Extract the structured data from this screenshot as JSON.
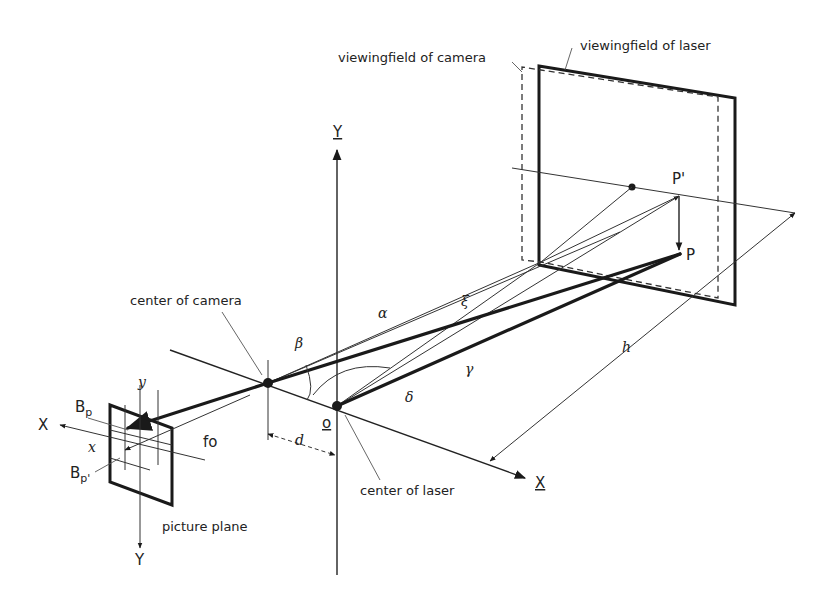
{
  "figure": {
    "type": "technical-diagram"
  },
  "labels": {
    "viewingfield_camera": "viewingfield of camera",
    "viewingfield_laser": "viewingfield of laser",
    "center_camera": "center of camera",
    "center_laser": "center of laser",
    "picture_plane": "picture plane",
    "point_p_prime": "P'",
    "point_p": "P",
    "axis_Y_world": "Y",
    "axis_X_world": "X",
    "axis_X_image": "X",
    "axis_Y_image": "Y",
    "axis_x_small": "x",
    "axis_y_small": "y",
    "origin": "o",
    "bp": "B",
    "bp_sub": "p",
    "bp_prime": "B",
    "bp_prime_sub": "p'",
    "focal": "fo",
    "distance_d": "d",
    "distance_h": "h",
    "alpha": "α",
    "beta": "β",
    "gamma": "γ",
    "delta": "δ",
    "zeta": "ξ"
  },
  "colors": {
    "ink": "#1a1a1a",
    "background": "#ffffff"
  }
}
